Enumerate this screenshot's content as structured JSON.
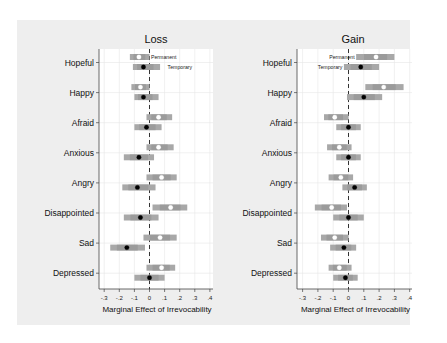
{
  "chart_data": [
    {
      "type": "coefficient-plot",
      "title": "Loss",
      "xlabel": "Marginal Effect of Irrevocability",
      "ylabel": "",
      "xlim": [
        -0.3,
        0.4
      ],
      "xticks": [
        "-.3",
        "-.2",
        "-.1",
        "0",
        ".1",
        ".2",
        ".3",
        ".4"
      ],
      "grid": true,
      "reference_line": 0,
      "legend": {
        "entries": [
          "Permanent",
          "Temporary"
        ],
        "position": "inline next to Hopeful markers (right)"
      },
      "categories": [
        "Hopeful",
        "Happy",
        "Afraid",
        "Anxious",
        "Angry",
        "Disappointed",
        "Sad",
        "Depressed"
      ],
      "series": [
        {
          "name": "Permanent",
          "marker": "white circle",
          "values": [
            -0.07,
            -0.06,
            0.06,
            0.06,
            0.08,
            0.14,
            0.07,
            0.08
          ],
          "ci_low": [
            -0.13,
            -0.12,
            -0.02,
            -0.02,
            -0.02,
            0.02,
            -0.04,
            -0.02
          ],
          "ci_high": [
            0.0,
            0.0,
            0.15,
            0.16,
            0.18,
            0.25,
            0.18,
            0.17
          ]
        },
        {
          "name": "Temporary",
          "marker": "black circle",
          "values": [
            -0.04,
            -0.04,
            -0.02,
            -0.07,
            -0.08,
            -0.06,
            -0.15,
            0.0
          ],
          "ci_low": [
            -0.11,
            -0.1,
            -0.1,
            -0.17,
            -0.18,
            -0.17,
            -0.26,
            -0.1
          ],
          "ci_high": [
            0.07,
            0.06,
            0.08,
            0.03,
            0.04,
            0.06,
            -0.03,
            0.1
          ]
        }
      ]
    },
    {
      "type": "coefficient-plot",
      "title": "Gain",
      "xlabel": "Marginal Effect of Irrevocability",
      "ylabel": "",
      "xlim": [
        -0.3,
        0.4
      ],
      "xticks": [
        "-.3",
        "-.2",
        "-.1",
        "0",
        ".1",
        ".2",
        ".3",
        ".4"
      ],
      "grid": true,
      "reference_line": 0,
      "legend": {
        "entries": [
          "Permanent",
          "Temporary"
        ],
        "position": "inline next to Hopeful markers (left)"
      },
      "categories": [
        "Hopeful",
        "Happy",
        "Afraid",
        "Anxious",
        "Angry",
        "Disappointed",
        "Sad",
        "Depressed"
      ],
      "series": [
        {
          "name": "Permanent",
          "marker": "white circle",
          "values": [
            0.18,
            0.23,
            -0.09,
            -0.06,
            -0.05,
            -0.11,
            -0.09,
            -0.06
          ],
          "ci_low": [
            0.05,
            0.11,
            -0.16,
            -0.14,
            -0.13,
            -0.22,
            -0.18,
            -0.13
          ],
          "ci_high": [
            0.3,
            0.36,
            0.0,
            0.02,
            0.03,
            -0.01,
            0.0,
            0.02
          ]
        },
        {
          "name": "Temporary",
          "marker": "black circle",
          "values": [
            0.08,
            0.1,
            0.0,
            0.0,
            0.04,
            0.0,
            -0.03,
            -0.02
          ],
          "ci_low": [
            -0.03,
            -0.01,
            -0.08,
            -0.08,
            -0.04,
            -0.1,
            -0.12,
            -0.1
          ],
          "ci_high": [
            0.2,
            0.22,
            0.08,
            0.08,
            0.12,
            0.1,
            0.05,
            0.06
          ]
        }
      ]
    }
  ],
  "colors": {
    "background": "#ffffff",
    "frame": "#eeeeee",
    "plot_area": "#ffffff",
    "grid": "#e6e6e6",
    "ci_band": "#a8a8a8",
    "ci_inner": "#8f8f8f",
    "permanent_marker": "#ffffff",
    "temporary_marker": "#000000",
    "reference_line": "#333333"
  }
}
